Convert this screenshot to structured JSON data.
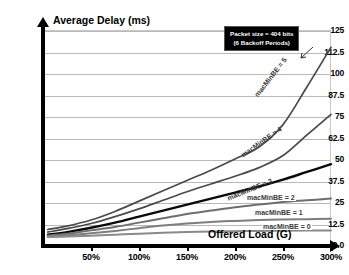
{
  "chart_data": {
    "type": "line",
    "title": "Average Delay (ms)",
    "xlabel": "Offered Load (G)",
    "ylabel": "Average Delay (ms)",
    "xlim": [
      0,
      300
    ],
    "ylim": [
      0,
      125
    ],
    "grid": true,
    "legend_position": "inline-curve-labels",
    "x_tick_labels": [
      "50%",
      "100%",
      "150%",
      "200%",
      "250%",
      "300%"
    ],
    "x_ticks": [
      50,
      100,
      150,
      200,
      250,
      300
    ],
    "y_tick_labels": [
      "125",
      "112.5",
      "100",
      "87.5",
      "75",
      "62.5",
      "50",
      "37.5",
      "25",
      "12.5",
      "0.0"
    ],
    "y_ticks": [
      125,
      112.5,
      100,
      87.5,
      75,
      62.5,
      50,
      37.5,
      25,
      12.5,
      0
    ],
    "annotation": {
      "line1": "Packet size = 404 bits",
      "line2": "(6 Backoff Periods)"
    },
    "x": [
      5,
      25,
      50,
      75,
      100,
      125,
      150,
      175,
      200,
      225,
      250,
      275,
      300
    ],
    "series": [
      {
        "name": "macMinBE = 5",
        "label": "macMinBE = 5",
        "color": "#4a4a4a",
        "width": 1.7,
        "values": [
          9.0,
          11.0,
          14.5,
          19.5,
          25.5,
          31.5,
          37.5,
          43.5,
          50.0,
          57.0,
          70.0,
          92.0,
          115.0
        ]
      },
      {
        "name": "macMinBE = 4",
        "label": "macMinBE = 4",
        "color": "#4a4a4a",
        "width": 1.7,
        "values": [
          7.5,
          9.5,
          12.5,
          16.5,
          21.0,
          26.0,
          31.0,
          35.5,
          40.0,
          45.0,
          52.0,
          64.0,
          76.0
        ]
      },
      {
        "name": "macMinBE = 3",
        "label": "macMinBE = 3",
        "color": "#0a0a0a",
        "width": 2.4,
        "values": [
          6.0,
          7.5,
          10.0,
          13.0,
          16.5,
          20.0,
          23.5,
          27.0,
          30.5,
          34.0,
          38.0,
          42.5,
          47.0
        ]
      },
      {
        "name": "macMinBE = 2",
        "label": "macMinBE = 2",
        "color": "#6e6e6e",
        "width": 2.0,
        "values": [
          5.5,
          6.5,
          8.5,
          10.5,
          13.0,
          15.5,
          18.0,
          20.0,
          22.0,
          23.5,
          25.0,
          26.0,
          27.0
        ]
      },
      {
        "name": "macMinBE = 1",
        "label": "macMinBE = 1",
        "color": "#7e7e7e",
        "width": 2.0,
        "values": [
          5.0,
          5.6,
          6.8,
          8.2,
          9.8,
          11.3,
          12.5,
          13.4,
          14.0,
          14.5,
          14.8,
          15.0,
          15.2
        ]
      },
      {
        "name": "macMinBE = 0",
        "label": "macMinBE = 0",
        "color": "#8a8a8a",
        "width": 2.0,
        "values": [
          4.6,
          4.9,
          5.4,
          6.0,
          6.6,
          7.1,
          7.5,
          7.8,
          8.0,
          8.2,
          8.3,
          8.4,
          8.5
        ]
      }
    ]
  }
}
